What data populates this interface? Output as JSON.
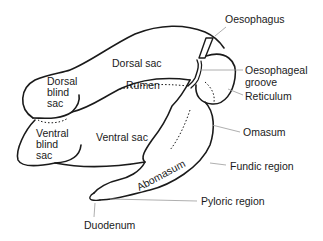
{
  "diagram": {
    "labels": {
      "oesophagus": "Oesophagus",
      "dorsal_sac": "Dorsal sac",
      "oesophageal_groove_line1": "Oesophageal",
      "oesophageal_groove_line2": "groove",
      "dorsal_blind_sac_line1": "Dorsal",
      "dorsal_blind_sac_line2": "blind",
      "dorsal_blind_sac_line3": "sac",
      "rumen": "Rumen",
      "reticulum": "Reticulum",
      "ventral_blind_sac_line1": "Ventral",
      "ventral_blind_sac_line2": "blind",
      "ventral_blind_sac_line3": "sac",
      "ventral_sac": "Ventral sac",
      "omasum": "Omasum",
      "fundic_region": "Fundic region",
      "abomasum": "Abomasum",
      "pyloric_region": "Pyloric region",
      "duodenum": "Duodenum"
    },
    "colors": {
      "outline": "#1a1a1a",
      "leader": "#9a9a9a"
    }
  }
}
